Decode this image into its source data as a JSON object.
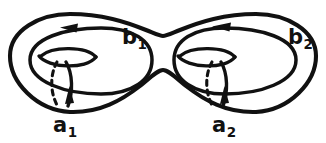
{
  "figure": {
    "kind": "genus-2-surface",
    "background_color": "#ffffff",
    "stroke_color": "#111111",
    "labels": {
      "b1": {
        "base": "b",
        "sub": "1",
        "text": "b1",
        "role": "longitude-cycle-left"
      },
      "b2": {
        "base": "b",
        "sub": "2",
        "text": "b2",
        "role": "longitude-cycle-right"
      },
      "a1": {
        "base": "a",
        "sub": "1",
        "text": "a1",
        "role": "meridian-cycle-left"
      },
      "a2": {
        "base": "a",
        "sub": "2",
        "text": "a2",
        "role": "meridian-cycle-right"
      }
    },
    "cycles": [
      {
        "name": "b1",
        "orientation": "arrow-points-left",
        "style": "solid",
        "position": "top-of-left-inner-loop"
      },
      {
        "name": "b2",
        "orientation": "arrow-points-left",
        "style": "solid",
        "position": "top-of-right-inner-loop"
      },
      {
        "name": "a1",
        "orientation": "arrow-points-up",
        "style": "solid-front-dashed-back",
        "position": "left-handle"
      },
      {
        "name": "a2",
        "orientation": "arrow-points-up",
        "style": "solid-front-dashed-back",
        "position": "right-handle"
      }
    ],
    "handles": 2,
    "holes": 2
  }
}
